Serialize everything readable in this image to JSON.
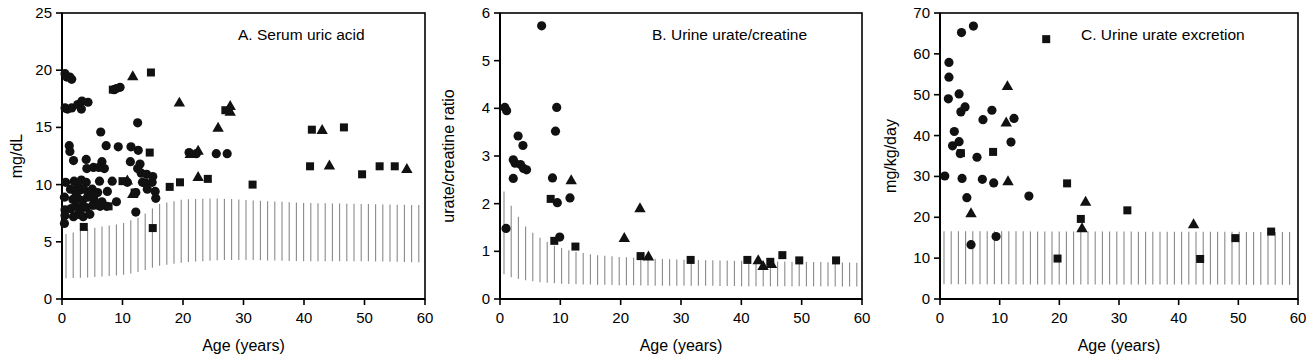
{
  "figure": {
    "panel_count": 3,
    "shared_xlabel": "Age (years)"
  },
  "panels": [
    {
      "id": "A",
      "title": "A.  Serum uric acid",
      "ylabel": "mg/dL",
      "xlabel": "Age (years)"
    },
    {
      "id": "B",
      "title": "B. Urine urate/creatine",
      "ylabel": "urate/creatine ratio",
      "xlabel": "Age (years)"
    },
    {
      "id": "C",
      "title": "C.  Urine urate excretion",
      "ylabel": "mg/kg/day",
      "xlabel": "Age (years)"
    }
  ],
  "chart_data": [
    {
      "type": "scatter",
      "panel": "A",
      "title": "A.  Serum uric acid",
      "xlabel": "Age (years)",
      "ylabel": "mg/dL",
      "xlim": [
        0,
        60
      ],
      "ylim": [
        0,
        25
      ],
      "xticks": [
        0,
        10,
        20,
        30,
        40,
        50,
        60
      ],
      "yticks": [
        0,
        5,
        10,
        15,
        20,
        25
      ],
      "grid": false,
      "legend": "none",
      "marker_color": "#111111",
      "reference_band": {
        "label": "normal range (hatched)",
        "x": [
          0,
          5,
          10,
          13,
          16,
          20,
          26,
          32,
          40,
          50,
          60
        ],
        "upper": [
          5.6,
          6.2,
          6.6,
          7.2,
          8.3,
          8.7,
          8.8,
          8.6,
          8.4,
          8.3,
          8.2
        ],
        "lower": [
          1.8,
          1.9,
          2.1,
          2.4,
          2.9,
          3.2,
          3.4,
          3.4,
          3.3,
          3.3,
          3.2
        ]
      },
      "series": [
        {
          "name": "circle",
          "marker": "circle",
          "points": [
            [
              0.5,
              19.7
            ],
            [
              0.8,
              19.4
            ],
            [
              1.3,
              19.4
            ],
            [
              1.6,
              19.2
            ],
            [
              0.5,
              16.7
            ],
            [
              0.9,
              16.6
            ],
            [
              1.6,
              16.7
            ],
            [
              2.6,
              17.0
            ],
            [
              3.3,
              17.3
            ],
            [
              3.2,
              16.6
            ],
            [
              4.3,
              17.2
            ],
            [
              8.6,
              18.3
            ],
            [
              9.0,
              18.4
            ],
            [
              9.6,
              18.5
            ],
            [
              6.4,
              14.6
            ],
            [
              12.5,
              15.4
            ],
            [
              1.2,
              13.4
            ],
            [
              1.3,
              12.9
            ],
            [
              7.3,
              13.4
            ],
            [
              9.3,
              13.3
            ],
            [
              11.4,
              13.3
            ],
            [
              12.6,
              13.0
            ],
            [
              21.0,
              12.8
            ],
            [
              22.2,
              12.7
            ],
            [
              25.5,
              12.7
            ],
            [
              27.3,
              12.7
            ],
            [
              1.9,
              12.1
            ],
            [
              4.0,
              12.2
            ],
            [
              6.6,
              12.0
            ],
            [
              11.3,
              12.0
            ],
            [
              12.9,
              11.8
            ],
            [
              12.5,
              11.4
            ],
            [
              4.1,
              11.4
            ],
            [
              5.2,
              11.5
            ],
            [
              6.1,
              11.5
            ],
            [
              7.0,
              11.4
            ],
            [
              13.1,
              11.0
            ],
            [
              14.0,
              10.9
            ],
            [
              15.0,
              10.7
            ],
            [
              0.6,
              10.2
            ],
            [
              2.0,
              10.3
            ],
            [
              2.6,
              10.0
            ],
            [
              3.2,
              10.4
            ],
            [
              4.0,
              10.2
            ],
            [
              6.2,
              10.3
            ],
            [
              8.3,
              10.3
            ],
            [
              10.8,
              10.2
            ],
            [
              13.3,
              10.2
            ],
            [
              13.9,
              10.1
            ],
            [
              14.9,
              10.2
            ],
            [
              1.4,
              9.6
            ],
            [
              2.2,
              9.4
            ],
            [
              2.9,
              9.5
            ],
            [
              3.6,
              9.6
            ],
            [
              4.4,
              9.3
            ],
            [
              5.0,
              9.6
            ],
            [
              5.9,
              9.3
            ],
            [
              7.5,
              9.4
            ],
            [
              12.2,
              9.3
            ],
            [
              14.1,
              9.6
            ],
            [
              15.4,
              9.4
            ],
            [
              0.4,
              8.9
            ],
            [
              1.8,
              8.7
            ],
            [
              2.6,
              8.8
            ],
            [
              3.4,
              8.6
            ],
            [
              4.2,
              8.9
            ],
            [
              5.3,
              8.6
            ],
            [
              6.6,
              8.5
            ],
            [
              9.0,
              8.5
            ],
            [
              15.5,
              8.8
            ],
            [
              0.5,
              7.8
            ],
            [
              1.5,
              7.9
            ],
            [
              2.3,
              8.1
            ],
            [
              3.1,
              7.9
            ],
            [
              4.0,
              8.0
            ],
            [
              5.1,
              8.2
            ],
            [
              6.3,
              8.1
            ],
            [
              7.4,
              8.1
            ],
            [
              0.5,
              7.3
            ],
            [
              1.9,
              7.2
            ],
            [
              2.7,
              7.4
            ],
            [
              3.5,
              7.2
            ],
            [
              4.6,
              7.4
            ],
            [
              12.2,
              7.6
            ],
            [
              0.4,
              6.6
            ]
          ]
        },
        {
          "name": "triangle",
          "marker": "triangle",
          "points": [
            [
              11.7,
              19.5
            ],
            [
              19.4,
              17.2
            ],
            [
              27.8,
              16.4
            ],
            [
              27.8,
              16.9
            ],
            [
              25.8,
              15.0
            ],
            [
              43.0,
              14.8
            ],
            [
              21.2,
              12.7
            ],
            [
              22.5,
              13.0
            ],
            [
              10.8,
              10.4
            ],
            [
              11.7,
              9.2
            ],
            [
              22.5,
              10.7
            ],
            [
              44.2,
              11.7
            ],
            [
              57.0,
              11.4
            ],
            [
              5.2,
              8.2
            ]
          ]
        },
        {
          "name": "square",
          "marker": "square",
          "points": [
            [
              14.7,
              19.8
            ],
            [
              8.4,
              18.3
            ],
            [
              27.0,
              16.5
            ],
            [
              41.3,
              14.8
            ],
            [
              46.6,
              15.0
            ],
            [
              14.5,
              12.8
            ],
            [
              24.1,
              10.5
            ],
            [
              19.5,
              10.2
            ],
            [
              17.8,
              9.8
            ],
            [
              31.5,
              10.0
            ],
            [
              41.0,
              11.6
            ],
            [
              49.6,
              10.9
            ],
            [
              52.5,
              11.6
            ],
            [
              55.0,
              11.6
            ],
            [
              10.0,
              10.3
            ],
            [
              12.0,
              9.3
            ],
            [
              5.3,
              9.1
            ],
            [
              7.7,
              8.1
            ],
            [
              3.6,
              6.3
            ],
            [
              15.0,
              6.2
            ]
          ]
        }
      ]
    },
    {
      "type": "scatter",
      "panel": "B",
      "title": "B. Urine urate/creatine",
      "xlabel": "Age (years)",
      "ylabel": "urate/creatine ratio",
      "xlim": [
        0,
        60
      ],
      "ylim": [
        0,
        6
      ],
      "xticks": [
        0,
        10,
        20,
        30,
        40,
        50,
        60
      ],
      "yticks": [
        0,
        1,
        2,
        3,
        4,
        5,
        6
      ],
      "grid": false,
      "legend": "none",
      "marker_color": "#111111",
      "reference_band": {
        "label": "normal range (hatched)",
        "x": [
          0,
          2,
          4,
          6,
          9,
          12,
          16,
          20,
          26,
          32,
          40,
          50,
          60
        ],
        "upper": [
          2.42,
          1.92,
          1.55,
          1.33,
          1.12,
          1.0,
          0.92,
          0.88,
          0.84,
          0.82,
          0.8,
          0.78,
          0.76
        ],
        "lower": [
          0.55,
          0.45,
          0.4,
          0.36,
          0.33,
          0.31,
          0.3,
          0.29,
          0.28,
          0.28,
          0.27,
          0.27,
          0.26
        ]
      },
      "series": [
        {
          "name": "circle",
          "marker": "circle",
          "points": [
            [
              6.9,
              5.73
            ],
            [
              0.8,
              4.02
            ],
            [
              1.1,
              3.95
            ],
            [
              9.4,
              4.02
            ],
            [
              9.2,
              3.52
            ],
            [
              3.0,
              3.42
            ],
            [
              3.8,
              3.22
            ],
            [
              2.2,
              2.92
            ],
            [
              2.5,
              2.85
            ],
            [
              3.4,
              2.82
            ],
            [
              3.9,
              2.74
            ],
            [
              4.4,
              2.71
            ],
            [
              2.2,
              2.53
            ],
            [
              8.7,
              2.54
            ],
            [
              11.6,
              2.12
            ],
            [
              9.5,
              2.02
            ],
            [
              1.0,
              1.48
            ],
            [
              9.9,
              1.3
            ]
          ]
        },
        {
          "name": "triangle",
          "marker": "triangle",
          "points": [
            [
              11.8,
              2.5
            ],
            [
              23.2,
              1.91
            ],
            [
              20.6,
              1.29
            ],
            [
              24.6,
              0.9
            ],
            [
              42.8,
              0.82
            ],
            [
              43.6,
              0.7
            ],
            [
              45.0,
              0.74
            ]
          ]
        },
        {
          "name": "square",
          "marker": "square",
          "points": [
            [
              8.4,
              2.1
            ],
            [
              9.0,
              1.22
            ],
            [
              12.5,
              1.1
            ],
            [
              23.3,
              0.9
            ],
            [
              31.6,
              0.82
            ],
            [
              41.0,
              0.82
            ],
            [
              44.8,
              0.78
            ],
            [
              46.8,
              0.92
            ],
            [
              49.6,
              0.81
            ],
            [
              55.7,
              0.81
            ]
          ]
        }
      ]
    },
    {
      "type": "scatter",
      "panel": "C",
      "title": "C.  Urine urate excretion",
      "xlabel": "Age (years)",
      "ylabel": "mg/kg/day",
      "xlim": [
        0,
        60
      ],
      "ylim": [
        0,
        70
      ],
      "xticks": [
        0,
        10,
        20,
        30,
        40,
        50,
        60
      ],
      "yticks": [
        0,
        10,
        20,
        30,
        40,
        50,
        60,
        70
      ],
      "grid": false,
      "legend": "none",
      "marker_color": "#111111",
      "reference_band": {
        "label": "normal range (hatched)",
        "x": [
          0,
          60
        ],
        "upper": [
          16.6,
          16.4
        ],
        "lower": [
          3.6,
          3.5
        ]
      },
      "series": [
        {
          "name": "circle",
          "marker": "circle",
          "points": [
            [
              5.6,
              66.8
            ],
            [
              3.6,
              65.2
            ],
            [
              1.5,
              57.9
            ],
            [
              1.5,
              54.3
            ],
            [
              1.4,
              49.0
            ],
            [
              3.2,
              50.2
            ],
            [
              4.2,
              47.0
            ],
            [
              3.5,
              45.8
            ],
            [
              8.7,
              46.2
            ],
            [
              7.2,
              43.9
            ],
            [
              12.4,
              44.2
            ],
            [
              2.4,
              41.0
            ],
            [
              2.1,
              37.5
            ],
            [
              3.2,
              38.5
            ],
            [
              11.9,
              38.4
            ],
            [
              3.4,
              35.6
            ],
            [
              6.2,
              34.7
            ],
            [
              0.8,
              30.1
            ],
            [
              3.7,
              29.5
            ],
            [
              7.1,
              29.3
            ],
            [
              9.0,
              28.4
            ],
            [
              4.5,
              24.8
            ],
            [
              14.9,
              25.2
            ],
            [
              5.2,
              13.3
            ],
            [
              9.4,
              15.3
            ]
          ]
        },
        {
          "name": "triangle",
          "marker": "triangle",
          "points": [
            [
              11.3,
              52.2
            ],
            [
              11.1,
              43.3
            ],
            [
              11.4,
              28.9
            ],
            [
              24.4,
              23.9
            ],
            [
              23.8,
              17.4
            ],
            [
              42.5,
              18.4
            ],
            [
              5.2,
              21.1
            ]
          ]
        },
        {
          "name": "square",
          "marker": "square",
          "points": [
            [
              17.8,
              63.6
            ],
            [
              3.5,
              35.7
            ],
            [
              8.9,
              36.0
            ],
            [
              21.3,
              28.3
            ],
            [
              23.6,
              19.6
            ],
            [
              31.4,
              21.7
            ],
            [
              49.5,
              14.9
            ],
            [
              55.5,
              16.5
            ],
            [
              19.7,
              9.9
            ],
            [
              43.6,
              9.8
            ]
          ]
        }
      ]
    }
  ]
}
